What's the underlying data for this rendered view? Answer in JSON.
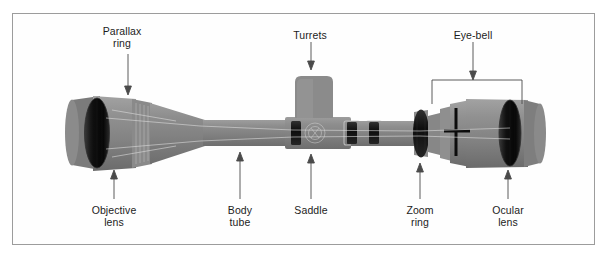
{
  "figure": {
    "frame": {
      "border_color": "#9c9c9c",
      "background": "#fefefe"
    },
    "colors": {
      "scope_body": "#8d8d8d",
      "scope_body_light": "#a5a5a5",
      "scope_body_dark": "#6f6f6f",
      "lens_dark": "#1a1a1a",
      "ring_dark": "#1f1f1f",
      "label_text": "#1c1c1c",
      "leader_line": "#555555"
    },
    "labels_top": [
      {
        "id": "parallax-ring",
        "text": "Parallax\nring",
        "x": 122,
        "y": 26
      },
      {
        "id": "turrets",
        "text": "Turrets",
        "x": 310,
        "y": 30
      },
      {
        "id": "eye-bell",
        "text": "Eye-bell",
        "x": 473,
        "y": 30
      }
    ],
    "labels_bottom": [
      {
        "id": "objective-lens",
        "text": "Objective\nlens",
        "x": 114,
        "y": 205
      },
      {
        "id": "body-tube",
        "text": "Body\ntube",
        "x": 240,
        "y": 205
      },
      {
        "id": "saddle",
        "text": "Saddle",
        "x": 311,
        "y": 205
      },
      {
        "id": "zoom-ring",
        "text": "Zoom\nring",
        "x": 420,
        "y": 205
      },
      {
        "id": "ocular-lens",
        "text": "Ocular\nlens",
        "x": 508,
        "y": 205
      }
    ],
    "eye_bell_bracket": {
      "left": 432,
      "right": 522,
      "top": 79,
      "leg_bottom": 104
    },
    "scope_parts": [
      "objective lens",
      "parallax ring",
      "body tube",
      "saddle",
      "turrets",
      "zoom ring",
      "eye-bell",
      "ocular lens"
    ]
  }
}
